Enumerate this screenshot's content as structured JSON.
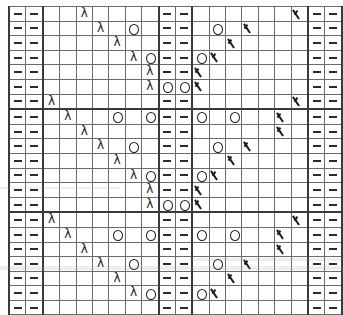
{
  "document": {
    "title": "Lace Knitting Stitch Chart",
    "type": "knitting-chart"
  },
  "legend": {
    "dash": "purl stitch",
    "yo": "yarn over",
    "lam": "ssk / left-leaning decrease",
    "k2t": "k2tog / right-leaning decrease",
    "blank": "knit stitch"
  },
  "chart_data": {
    "type": "heatmap",
    "xlabel": "",
    "ylabel": "",
    "columns": 20,
    "rows": 21,
    "symbol_key": {
      "-": "blank",
      "d": "dash",
      "o": "yo",
      "l": "lam",
      "k": "k2t"
    },
    "grid": [
      [
        "d",
        "d",
        "-",
        "-",
        "l",
        "-",
        "-",
        "-",
        "-",
        "d",
        "d",
        "-",
        "-",
        "-",
        "-",
        "-",
        "-",
        "k",
        "d",
        "d"
      ],
      [
        "d",
        "d",
        "-",
        "-",
        "-",
        "l",
        "-",
        "o",
        "-",
        "d",
        "d",
        "-",
        "o",
        "-",
        "k",
        "-",
        "-",
        "-",
        "d",
        "d"
      ],
      [
        "d",
        "d",
        "-",
        "-",
        "-",
        "-",
        "l",
        "-",
        "-",
        "d",
        "d",
        "-",
        "-",
        "k",
        "-",
        "-",
        "-",
        "-",
        "d",
        "d"
      ],
      [
        "d",
        "d",
        "-",
        "-",
        "-",
        "-",
        "-",
        "l",
        "o",
        "d",
        "d",
        "o",
        "k",
        "-",
        "-",
        "-",
        "-",
        "-",
        "d",
        "d"
      ],
      [
        "d",
        "d",
        "-",
        "-",
        "-",
        "-",
        "-",
        "-",
        "l",
        "d",
        "d",
        "k",
        "-",
        "-",
        "-",
        "-",
        "-",
        "-",
        "d",
        "d"
      ],
      [
        "d",
        "d",
        "-",
        "-",
        "-",
        "-",
        "-",
        "-",
        "l",
        "o",
        "o",
        "k",
        "-",
        "-",
        "-",
        "-",
        "-",
        "-",
        "d",
        "d"
      ],
      [
        "d",
        "d",
        "l",
        "-",
        "-",
        "-",
        "-",
        "-",
        "-",
        "d",
        "d",
        "-",
        "-",
        "-",
        "-",
        "-",
        "-",
        "k",
        "d",
        "d"
      ],
      [
        "d",
        "d",
        "-",
        "l",
        "-",
        "-",
        "o",
        "-",
        "o",
        "d",
        "d",
        "o",
        "-",
        "o",
        "-",
        "-",
        "k",
        "-",
        "d",
        "d"
      ],
      [
        "d",
        "d",
        "-",
        "-",
        "l",
        "-",
        "-",
        "-",
        "-",
        "d",
        "d",
        "-",
        "-",
        "-",
        "-",
        "-",
        "k",
        "-",
        "d",
        "d"
      ],
      [
        "d",
        "d",
        "-",
        "-",
        "-",
        "l",
        "-",
        "o",
        "-",
        "d",
        "d",
        "-",
        "o",
        "-",
        "k",
        "-",
        "-",
        "-",
        "d",
        "d"
      ],
      [
        "d",
        "d",
        "-",
        "-",
        "-",
        "-",
        "l",
        "-",
        "-",
        "d",
        "d",
        "-",
        "-",
        "k",
        "-",
        "-",
        "-",
        "-",
        "d",
        "d"
      ],
      [
        "d",
        "d",
        "-",
        "-",
        "-",
        "-",
        "-",
        "l",
        "o",
        "d",
        "d",
        "o",
        "k",
        "-",
        "-",
        "-",
        "-",
        "-",
        "d",
        "d"
      ],
      [
        "d",
        "d",
        "-",
        "-",
        "-",
        "-",
        "-",
        "-",
        "l",
        "d",
        "d",
        "k",
        "-",
        "-",
        "-",
        "-",
        "-",
        "-",
        "d",
        "d"
      ],
      [
        "d",
        "d",
        "-",
        "-",
        "-",
        "-",
        "-",
        "-",
        "l",
        "o",
        "o",
        "k",
        "-",
        "-",
        "-",
        "-",
        "-",
        "-",
        "d",
        "d"
      ],
      [
        "d",
        "d",
        "l",
        "-",
        "-",
        "-",
        "-",
        "-",
        "-",
        "d",
        "d",
        "-",
        "-",
        "-",
        "-",
        "-",
        "-",
        "k",
        "d",
        "d"
      ],
      [
        "d",
        "d",
        "-",
        "l",
        "-",
        "-",
        "o",
        "-",
        "o",
        "d",
        "d",
        "o",
        "-",
        "o",
        "-",
        "-",
        "k",
        "-",
        "d",
        "d"
      ],
      [
        "d",
        "d",
        "-",
        "-",
        "l",
        "-",
        "-",
        "-",
        "-",
        "d",
        "d",
        "-",
        "-",
        "-",
        "-",
        "-",
        "k",
        "-",
        "d",
        "d"
      ],
      [
        "d",
        "d",
        "-",
        "-",
        "-",
        "l",
        "-",
        "o",
        "-",
        "d",
        "d",
        "-",
        "o",
        "-",
        "k",
        "-",
        "-",
        "-",
        "d",
        "d"
      ],
      [
        "d",
        "d",
        "-",
        "-",
        "-",
        "-",
        "l",
        "-",
        "-",
        "d",
        "d",
        "-",
        "-",
        "k",
        "-",
        "-",
        "-",
        "-",
        "d",
        "d"
      ],
      [
        "d",
        "d",
        "-",
        "-",
        "-",
        "-",
        "-",
        "l",
        "o",
        "d",
        "d",
        "o",
        "k",
        "-",
        "-",
        "-",
        "-",
        "-",
        "d",
        "d"
      ],
      [
        "d",
        "d",
        "-",
        "-",
        "-",
        "-",
        "-",
        "-",
        "-",
        "d",
        "d",
        "-",
        "-",
        "-",
        "-",
        "-",
        "-",
        "-",
        "d",
        "d"
      ]
    ],
    "thick_column_lines": [
      2,
      9,
      11,
      18
    ],
    "thick_row_lines": [
      7,
      14
    ],
    "grid_on": true,
    "legend_position": "none"
  }
}
